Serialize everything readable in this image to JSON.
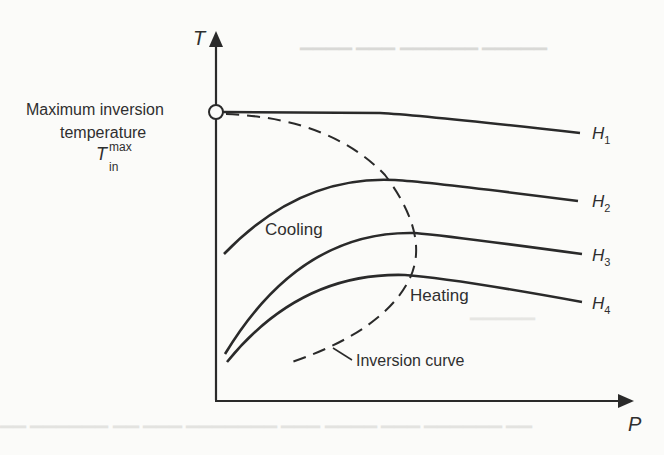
{
  "diagram": {
    "type": "thermodynamic-inversion-diagram",
    "axes": {
      "y_label": "T",
      "x_label": "P"
    },
    "annotations": {
      "max_inversion_line1": "Maximum inversion",
      "max_inversion_line2": "temperature",
      "symbol_base": "T",
      "symbol_sup": "max",
      "symbol_sub": "in",
      "cooling": "Cooling",
      "heating": "Heating",
      "inversion_curve": "Inversion curve"
    },
    "curves": [
      {
        "id": "H1",
        "base": "H",
        "sub": "1",
        "style": "solid"
      },
      {
        "id": "H2",
        "base": "H",
        "sub": "2",
        "style": "solid"
      },
      {
        "id": "H3",
        "base": "H",
        "sub": "3",
        "style": "solid"
      },
      {
        "id": "H4",
        "base": "H",
        "sub": "4",
        "style": "solid"
      },
      {
        "id": "inversion",
        "style": "dashed"
      }
    ],
    "colors": {
      "ink": "#2a2a2a",
      "paper": "#fbfbf9"
    }
  }
}
